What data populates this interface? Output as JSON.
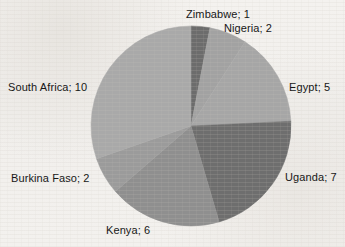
{
  "chart_data": {
    "type": "pie",
    "title": "",
    "subtitle": "",
    "xlabel": "",
    "ylabel": "",
    "legend_position": "none",
    "labels_inline": true,
    "label_format": "name; value",
    "grid": false,
    "total": 33,
    "start_angle_deg": 0,
    "direction": "clockwise",
    "categories": [
      "Zimbabwe",
      "Nigeria",
      "Egypt",
      "Uganda",
      "Kenya",
      "Burkina Faso",
      "South Africa"
    ],
    "values": [
      1,
      2,
      5,
      7,
      6,
      2,
      10
    ],
    "colors": [
      "#6c6c6c",
      "#a2a2a2",
      "#a6a6a6",
      "#6e6e6e",
      "#8f8f8f",
      "#9b9b9b",
      "#a9a9a9"
    ],
    "slices": [
      {
        "name": "Zimbabwe",
        "value": 1,
        "label": "Zimbabwe; 1",
        "color": "#6c6c6c"
      },
      {
        "name": "Nigeria",
        "value": 2,
        "label": "Nigeria; 2",
        "color": "#a2a2a2"
      },
      {
        "name": "Egypt",
        "value": 5,
        "label": "Egypt; 5",
        "color": "#a6a6a6"
      },
      {
        "name": "Uganda",
        "value": 7,
        "label": "Uganda; 7",
        "color": "#6e6e6e"
      },
      {
        "name": "Kenya",
        "value": 6,
        "label": "Kenya; 6",
        "color": "#8f8f8f"
      },
      {
        "name": "Burkina Faso",
        "value": 2,
        "label": "Burkina Faso; 2",
        "color": "#9b9b9b"
      },
      {
        "name": "South Africa",
        "value": 10,
        "label": "South Africa; 10",
        "color": "#a9a9a9"
      }
    ]
  },
  "labels": {
    "zimbabwe": "Zimbabwe; 1",
    "nigeria": "Nigeria; 2",
    "egypt": "Egypt; 5",
    "uganda": "Uganda; 7",
    "kenya": "Kenya; 6",
    "burkina_faso": "Burkina Faso; 2",
    "south_africa": "South Africa; 10"
  },
  "geometry": {
    "center_x": 191,
    "center_y": 126,
    "radius": 100
  },
  "style": {
    "background": "#f3f1ee",
    "text_color": "#171717"
  }
}
